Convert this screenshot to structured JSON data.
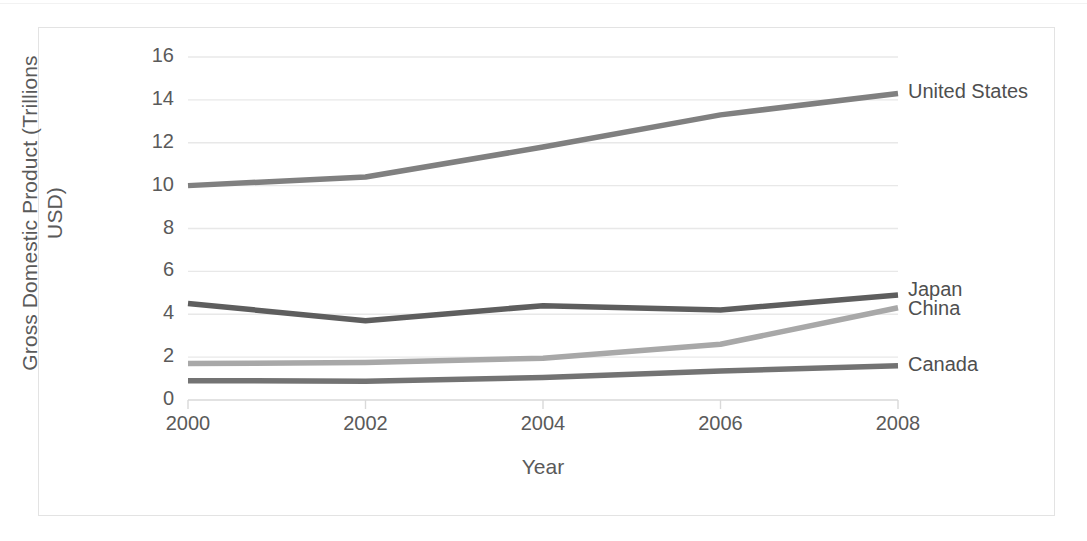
{
  "chart_data": {
    "type": "line",
    "title": "",
    "xlabel": "Year",
    "ylabel": "Gross Domestic Product (Trillions\nUSD)",
    "x": [
      2000,
      2002,
      2004,
      2006,
      2008
    ],
    "xtick_labels": [
      "2000",
      "2002",
      "2004",
      "2006",
      "2008"
    ],
    "ytick_labels": [
      "0",
      "2",
      "4",
      "6",
      "8",
      "10",
      "12",
      "14",
      "16"
    ],
    "ylim": [
      0,
      16
    ],
    "xlim": [
      2000,
      2008
    ],
    "grid": "horizontal",
    "legend_position": "right-of-line-ends",
    "series": [
      {
        "name": "United States",
        "values": [
          10.0,
          10.4,
          11.8,
          13.3,
          14.3
        ],
        "color": "#808080",
        "label_y_value": 14.3
      },
      {
        "name": "Japan",
        "values": [
          4.5,
          3.7,
          4.4,
          4.2,
          4.9
        ],
        "color": "#5e5e5e",
        "label_y_value": 5.1
      },
      {
        "name": "China",
        "values": [
          1.7,
          1.75,
          1.95,
          2.6,
          4.3
        ],
        "color": "#a8a8a8",
        "label_y_value": 4.2
      },
      {
        "name": "Canada",
        "values": [
          0.9,
          0.88,
          1.05,
          1.35,
          1.6
        ],
        "color": "#737373",
        "label_y_value": 1.6
      }
    ]
  },
  "colors": {
    "axis_text": "#5a5a5a",
    "gridline": "#e8e8e8",
    "axis_line": "#d9d9d9",
    "frame_border": "#e3e3e3",
    "background": "#ffffff"
  }
}
